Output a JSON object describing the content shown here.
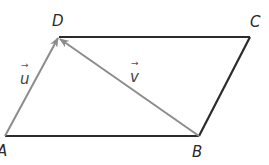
{
  "diagram": {
    "title": "",
    "type": "parallelogram",
    "vertices": [
      {
        "name": "A",
        "label": "A"
      },
      {
        "name": "B",
        "label": "B"
      },
      {
        "name": "C",
        "label": "C"
      },
      {
        "name": "D",
        "label": "D"
      }
    ],
    "edges": [
      {
        "from": "A",
        "to": "B",
        "style": "solid-dark"
      },
      {
        "from": "B",
        "to": "C",
        "style": "solid-dark"
      },
      {
        "from": "C",
        "to": "D",
        "style": "solid-dark"
      },
      {
        "from": "A",
        "to": "D",
        "style": "vector-gray",
        "vector_label": "u"
      },
      {
        "from": "B",
        "to": "D",
        "style": "vector-gray",
        "vector_label": "v"
      }
    ],
    "vectors": [
      {
        "name": "u",
        "label": "u",
        "arrow": "→",
        "from": "A",
        "to": "D"
      },
      {
        "name": "v",
        "label": "v",
        "arrow": "→",
        "from": "B",
        "to": "D"
      }
    ],
    "colors": {
      "edge": "#2b2b2b",
      "vector": "#8c8c8c",
      "label": "#2a2a2a"
    }
  }
}
